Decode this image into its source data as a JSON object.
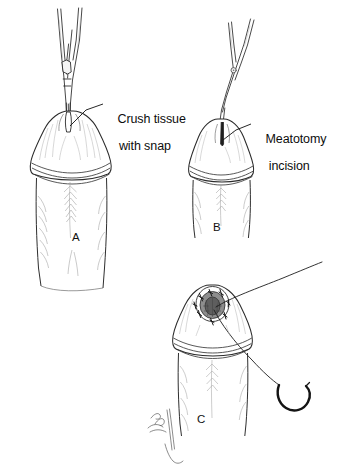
{
  "figure": {
    "background_color": "#ffffff",
    "ink_color": "#1a1a1a",
    "shading_color": "#9a9a9a",
    "style": "pen-and-ink line drawing",
    "width": 339,
    "height": 476
  },
  "labels": {
    "crush": {
      "line1": "Crush tissue",
      "line2": "with snap"
    },
    "meatotomy": {
      "line1": "Meatotomy",
      "line2": "incision"
    }
  },
  "panels": [
    {
      "letter": "A",
      "caption": "Crush tissue with snap",
      "instrument": "snap-hemostat",
      "description": "Straight snap (hemostat) inserted into the urethral meatus of the glans to crush the ventral tissue"
    },
    {
      "letter": "B",
      "caption": "Meatotomy incision",
      "instrument": "scissors",
      "description": "Scissors making the meatotomy incision through the crushed tissue"
    },
    {
      "letter": "C",
      "caption": "Suturing the meatotomy",
      "instrument": "curved-needle-with-suture",
      "description": "Enlarged meatus with interrupted sutures placed around the cut edges; curved needle and suture thread at right"
    }
  ],
  "signature": {
    "present": true,
    "text": "",
    "description": "illegible cursive artist signature at bottom center"
  }
}
